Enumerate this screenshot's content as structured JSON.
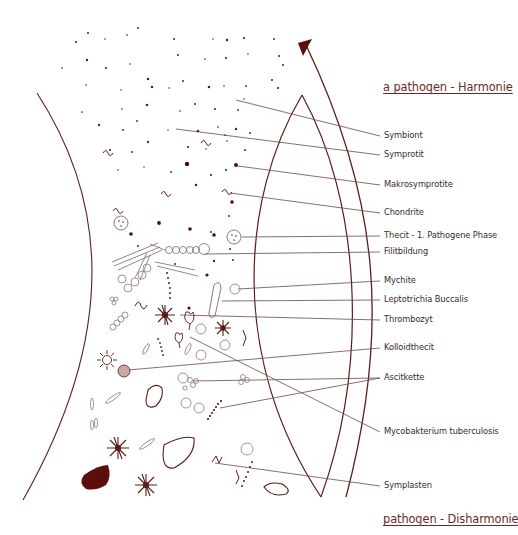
{
  "colors": {
    "ink": "#5a1d18",
    "dark_fill": "#5b0f0c",
    "leader_line": "#6a4a46",
    "outline": "#7a6a68",
    "label_text": "#3b2a2a",
    "heading_text": "#6b2a24"
  },
  "headings": {
    "top": "a pathogen - Harmonie",
    "bottom": "pathogen - Disharmonie"
  },
  "labels": [
    {
      "id": "symbiont",
      "text": "Symbiont",
      "x": 384,
      "y": 136,
      "from": [
        236,
        100
      ]
    },
    {
      "id": "symprotit",
      "text": "Symprotit",
      "x": 384,
      "y": 155,
      "from": [
        176,
        129
      ]
    },
    {
      "id": "makrosymprotite",
      "text": "Makrosymprotite",
      "x": 384,
      "y": 185,
      "from": [
        238,
        166
      ]
    },
    {
      "id": "chondrite",
      "text": "Chondrite",
      "x": 384,
      "y": 213,
      "from": [
        230,
        193
      ]
    },
    {
      "id": "thecit",
      "text": "Thecit - 1. Pathogene Phase",
      "x": 384,
      "y": 236,
      "from": [
        242,
        237
      ]
    },
    {
      "id": "filitbildung",
      "text": "Filitbildung",
      "x": 384,
      "y": 252,
      "from": [
        205,
        254
      ]
    },
    {
      "id": "mychite",
      "text": "Mychite",
      "x": 384,
      "y": 281,
      "from": [
        238,
        289
      ]
    },
    {
      "id": "leptotrichia",
      "text": "Leptotrichia Buccalis",
      "x": 384,
      "y": 300,
      "from": [
        222,
        301
      ]
    },
    {
      "id": "thrombozyt",
      "text": "Thrombozyt",
      "x": 384,
      "y": 320,
      "from": [
        180,
        315
      ]
    },
    {
      "id": "kolloidthecit",
      "text": "Kolloidthecit",
      "x": 384,
      "y": 348,
      "from": [
        128,
        370
      ]
    },
    {
      "id": "ascitkette",
      "text": "Ascitkette",
      "x": 384,
      "y": 378,
      "from": [
        193,
        381
      ],
      "from2": [
        220,
        408
      ]
    },
    {
      "id": "mycobakterium",
      "text": "Mycobakterium tuberculosis",
      "x": 384,
      "y": 432,
      "from": [
        190,
        337
      ]
    },
    {
      "id": "symplasten",
      "text": "Symplasten",
      "x": 384,
      "y": 486,
      "from": [
        215,
        463
      ]
    }
  ],
  "icons": {
    "arrow": "upward-arrow-icon",
    "left_boundary": "left-arc-boundary",
    "lens": "lens-shape",
    "organism_types": [
      "dot",
      "spiral",
      "vesicle",
      "chain",
      "star",
      "blob",
      "filament",
      "rod"
    ]
  }
}
